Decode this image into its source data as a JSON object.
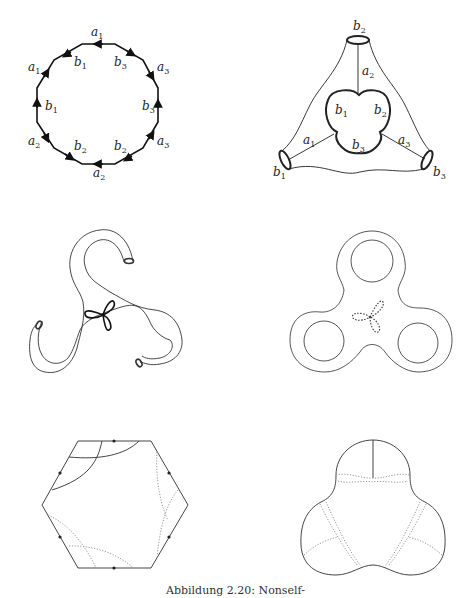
{
  "figure": {
    "caption": "Abbildung 2.20: Nonself-",
    "panels": [
      {
        "id": "dodecagon",
        "description": "12-gon with oriented edge labels",
        "edge_labels": [
          {
            "base": "a",
            "sub": "1",
            "x": 91,
            "y": 36
          },
          {
            "base": "b",
            "sub": "1",
            "x": 74,
            "y": 66
          },
          {
            "base": "b",
            "sub": "3",
            "x": 114,
            "y": 66
          },
          {
            "base": "a",
            "sub": "3",
            "x": 157,
            "y": 71
          },
          {
            "base": "a",
            "sub": "1",
            "x": 28,
            "y": 71
          },
          {
            "base": "b",
            "sub": "1",
            "x": 45,
            "y": 110
          },
          {
            "base": "b",
            "sub": "3",
            "x": 142,
            "y": 110
          },
          {
            "base": "a",
            "sub": "2",
            "x": 28,
            "y": 145
          },
          {
            "base": "a",
            "sub": "3",
            "x": 157,
            "y": 145
          },
          {
            "base": "b",
            "sub": "2",
            "x": 74,
            "y": 150
          },
          {
            "base": "b",
            "sub": "2",
            "x": 114,
            "y": 150
          },
          {
            "base": "a",
            "sub": "2",
            "x": 93,
            "y": 177
          }
        ]
      },
      {
        "id": "pants-surface",
        "description": "Surface with three boundary circles and inner trefoil",
        "labels": [
          {
            "base": "b",
            "sub": "2",
            "x": 353,
            "y": 30
          },
          {
            "base": "a",
            "sub": "2",
            "x": 362,
            "y": 75
          },
          {
            "base": "b",
            "sub": "1",
            "x": 335,
            "y": 114
          },
          {
            "base": "b",
            "sub": "2",
            "x": 374,
            "y": 114
          },
          {
            "base": "a",
            "sub": "1",
            "x": 303,
            "y": 144
          },
          {
            "base": "b",
            "sub": "3",
            "x": 352,
            "y": 149
          },
          {
            "base": "a",
            "sub": "3",
            "x": 398,
            "y": 144
          },
          {
            "base": "b",
            "sub": "1",
            "x": 273,
            "y": 176
          },
          {
            "base": "b",
            "sub": "3",
            "x": 433,
            "y": 176
          }
        ]
      },
      {
        "id": "tube-triskelion",
        "description": "Three-armed tube surface with trefoil loop"
      },
      {
        "id": "fidget-spinner",
        "description": "Genus-3 surface with dotted trefoil"
      },
      {
        "id": "hexagon",
        "description": "Hexagon with marked edges, solid and dotted arcs"
      },
      {
        "id": "trefoil-region",
        "description": "Three-lobed region with dotted geodesics"
      }
    ]
  }
}
